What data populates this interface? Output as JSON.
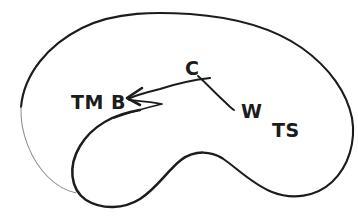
{
  "diagram": {
    "style": "hand-drawn line art, black ink on white",
    "canvas": {
      "width": 358,
      "height": 222,
      "background": "#ffffff"
    },
    "ink_color": "#1c1c1c",
    "faint_ink_color": "#8d8d8d",
    "labels": [
      {
        "id": "tm",
        "text": "TM",
        "x": 71,
        "y": 93
      },
      {
        "id": "b",
        "text": "B",
        "x": 111,
        "y": 93
      },
      {
        "id": "c",
        "text": "C",
        "x": 185,
        "y": 59
      },
      {
        "id": "w",
        "text": "W",
        "x": 241,
        "y": 102
      },
      {
        "id": "ts",
        "text": "TS",
        "x": 272,
        "y": 121
      }
    ],
    "annotations": {
      "arrow": {
        "name": "leftward-arrow",
        "direction": "left",
        "tip_x": 127,
        "tip_y": 98,
        "description": "curved arrow sweeping from lower right up to a tip pointing left toward label B"
      },
      "leader_line": {
        "name": "w-leader-line",
        "description": "curve descending from below label C to a tapered end beside label W",
        "end_x": 234,
        "end_y": 110
      }
    },
    "shapes": {
      "outer_boundary": "kidney / bean shaped closed outline",
      "inner_lobe": "rounded lobe indenting the outline from below",
      "faint_segment": "thin faded stroke closing the lower-left of the outer boundary"
    }
  }
}
